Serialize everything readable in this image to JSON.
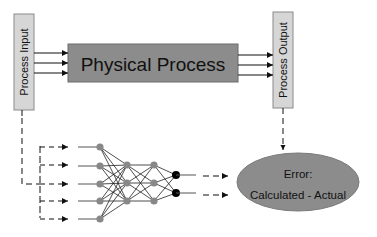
{
  "diagram": {
    "process_input": {
      "label": "Process Input"
    },
    "physical_process": {
      "label": "Physical Process"
    },
    "process_output": {
      "label": "Process Output"
    },
    "error_node": {
      "line1": "Error:",
      "line2": "Calculated - Actual"
    },
    "neural_network": {
      "layers": [
        5,
        3,
        3,
        2
      ],
      "input_arrow_count": 5,
      "output_arrow_count": 2
    },
    "colors": {
      "box_fill": "#d4d4d4",
      "process_fill": "#8a8a8a",
      "ellipse_fill": "#8c8c8c",
      "node_gray": "#888888",
      "node_black": "#000000",
      "line": "#222222"
    }
  }
}
